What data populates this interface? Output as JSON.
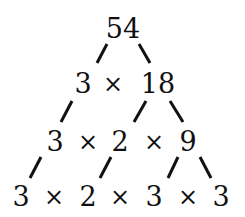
{
  "rows": [
    {
      "tokens": [
        "54"
      ]
    },
    {
      "tokens": [
        "3",
        "×",
        "18"
      ]
    },
    {
      "tokens": [
        "3",
        "×",
        "2",
        "×",
        "9"
      ]
    },
    {
      "tokens": [
        "3",
        "×",
        "2",
        "×",
        "3",
        "×",
        "3"
      ]
    }
  ],
  "nodes": {
    "r0": {
      "n0": "54"
    },
    "r1": {
      "n0": "3",
      "op0": "×",
      "n1": "18"
    },
    "r2": {
      "n0": "3",
      "op0": "×",
      "n1": "2",
      "op1": "×",
      "n2": "9"
    },
    "r3": {
      "n0": "3",
      "op0": "×",
      "n1": "2",
      "op1": "×",
      "n2": "3",
      "op2": "×",
      "n3": "3"
    }
  },
  "edges": [
    {
      "from": "54",
      "to": "3"
    },
    {
      "from": "54",
      "to": "18"
    },
    {
      "from": "3",
      "to": "3"
    },
    {
      "from": "18",
      "to": "2"
    },
    {
      "from": "18",
      "to": "9"
    },
    {
      "from": "3",
      "to": "3"
    },
    {
      "from": "2",
      "to": "2"
    },
    {
      "from": "9",
      "to": "3"
    },
    {
      "from": "9",
      "to": "3"
    }
  ],
  "colors": {
    "ink": "#111111",
    "background": "#ffffff"
  }
}
